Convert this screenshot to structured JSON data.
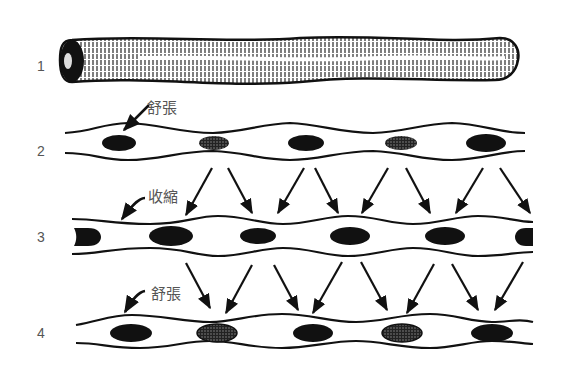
{
  "diagram": {
    "rows": [
      {
        "number": "1",
        "type": "tube"
      },
      {
        "number": "2",
        "label": "舒張",
        "state": "relaxation"
      },
      {
        "number": "3",
        "label": "收縮",
        "state": "contraction"
      },
      {
        "number": "4",
        "label": "舒張",
        "state": "relaxation"
      }
    ],
    "colors": {
      "ink": "#111111",
      "label": "#555555",
      "background": "#ffffff"
    }
  }
}
